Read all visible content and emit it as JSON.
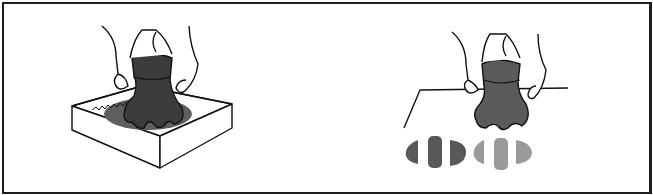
{
  "figure": {
    "panels": [
      {
        "id": "left",
        "description": "hands pressing stamp in ink tray"
      },
      {
        "id": "right",
        "description": "hands pressing stamp on surface leaving prints"
      }
    ],
    "colors": {
      "border": "#1e1e1e",
      "stamp": "#3c3c3c",
      "ink_dark": "#4a4a4a",
      "ink_mid": "#5e5e5e",
      "print_dark": "#585858",
      "print_light": "#9a9a9a",
      "line": "#111111"
    }
  }
}
